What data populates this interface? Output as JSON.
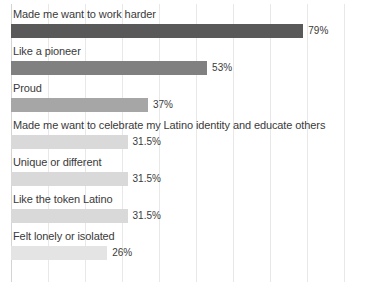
{
  "chart_data": {
    "type": "bar",
    "orientation": "horizontal",
    "title": "",
    "subtitle": "",
    "xlabel": "",
    "ylabel": "",
    "xlim": [
      0,
      100
    ],
    "xunit": "%",
    "grid": true,
    "grid_axis": "x",
    "grid_interval": 10,
    "legend": false,
    "legend_position": "none",
    "axis_tick_labels_visible": false,
    "data_labels_visible": true,
    "categories": [
      "Made me want to work harder",
      "Like a pioneer",
      "Proud",
      "Made me want to celebrate my Latino identity and educate others",
      "Unique or different",
      "Like the token Latino",
      "Felt lonely or isolated"
    ],
    "values": [
      79,
      53,
      37,
      31.5,
      31.5,
      31.5,
      26
    ],
    "value_labels": [
      "79%",
      "53%",
      "37%",
      "31.5%",
      "31.5%",
      "31.5%",
      "26%"
    ],
    "bar_colors": [
      "#595959",
      "#808080",
      "#a6a6a6",
      "#d9d9d9",
      "#d9d9d9",
      "#d9d9d9",
      "#e4e4e4"
    ],
    "gridline_values": [
      0,
      10,
      20,
      30,
      40,
      50,
      60,
      70,
      80,
      90
    ],
    "colors": {
      "background": "#ffffff",
      "gridline": "#e8e8e8",
      "axis": "#d4d4d4",
      "label_text": "#3a3a3a"
    }
  }
}
